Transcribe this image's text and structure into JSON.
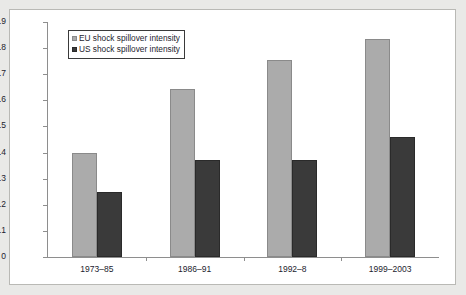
{
  "chart_data": {
    "type": "bar",
    "title": "",
    "subtitle": "",
    "xlabel": "",
    "ylabel": "",
    "categories": [
      "1973–85",
      "1986–91",
      "1992–8",
      "1999–2003"
    ],
    "series": [
      {
        "name": "EU shock spillover intensity",
        "color": "#ababab",
        "values": [
          0.4,
          0.645,
          0.755,
          0.835
        ]
      },
      {
        "name": "US shock spillover intensity",
        "color": "#3a3a3a",
        "values": [
          0.25,
          0.37,
          0.37,
          0.46
        ]
      }
    ],
    "ylim": [
      0,
      0.9
    ],
    "ytick_labels": [
      "0.9",
      "0.8",
      "0.7",
      "0.6",
      "0.5",
      "0.4",
      "0.3",
      "0.2",
      "0.1",
      "0"
    ],
    "ytick_values": [
      0.9,
      0.8,
      0.7,
      0.6,
      0.5,
      0.4,
      0.3,
      0.2,
      0.1,
      0
    ],
    "grid": false,
    "legend_position": "top-left"
  },
  "legend": {
    "entries": [
      {
        "label": "EU shock spillover intensity",
        "swatch": "eu-legend-swatch"
      },
      {
        "label": "US shock spillover intensity",
        "swatch": "us-legend-swatch"
      }
    ]
  },
  "colors": {
    "eu_bar": "#ababab",
    "us_bar": "#3a3a3a",
    "axis": "#8e8e8e",
    "text": "#1c1c2e",
    "page_background": "#e9e9e7",
    "plot_background": "#ffffff",
    "frame_border": "#b9b9b5"
  }
}
